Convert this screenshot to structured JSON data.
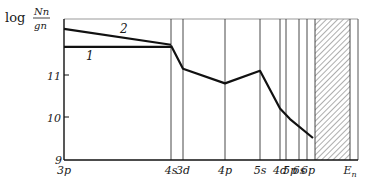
{
  "chart_data": {
    "type": "line",
    "title": "",
    "ylabel": "log N_n / g_n",
    "ylabel_parts": {
      "log": "log",
      "num": "N",
      "num_sub": "n",
      "den": "g",
      "den_sub": "n"
    },
    "xlabel": "",
    "ylim": [
      9,
      12.3
    ],
    "yticks": [
      {
        "label": "9",
        "value": 9
      },
      {
        "label": "10",
        "value": 10
      },
      {
        "label": "11",
        "value": 11
      }
    ],
    "categories": [
      "3p",
      "4s",
      "3d",
      "4p",
      "5s",
      "4d",
      "5p",
      "6s",
      "6p",
      "E_n"
    ],
    "category_labels": [
      {
        "label": "3p",
        "x": 64
      },
      {
        "label": "4s",
        "x": 171
      },
      {
        "label": "3d",
        "x": 183
      },
      {
        "label": "4p",
        "x": 225
      },
      {
        "label": "5s",
        "x": 260
      },
      {
        "label": "4d",
        "x": 280
      },
      {
        "label": "5p",
        "x": 290
      },
      {
        "label": "6s",
        "x": 299
      },
      {
        "label": "6p",
        "x": 308
      },
      {
        "label": "E",
        "sub": "n",
        "x": 350
      }
    ],
    "vertical_lines_x": [
      171,
      183,
      225,
      260,
      280,
      286,
      299,
      307,
      315,
      350
    ],
    "hatched_region": {
      "x_start": 315,
      "x_end": 350,
      "label": "continuum above E_n"
    },
    "series": [
      {
        "name": "1",
        "points": [
          {
            "level": "3p",
            "x": 64,
            "value": 11.67
          },
          {
            "level": "4s",
            "x": 171,
            "value": 11.67
          }
        ]
      },
      {
        "name": "2",
        "points": [
          {
            "level": "3p",
            "x": 64,
            "value": 12.1
          },
          {
            "level": "4s",
            "x": 171,
            "value": 11.72
          }
        ]
      },
      {
        "name": "common",
        "points": [
          {
            "level": "4s",
            "x": 171,
            "value": 11.7
          },
          {
            "level": "3d",
            "x": 183,
            "value": 11.15
          },
          {
            "level": "4p",
            "x": 225,
            "value": 10.8
          },
          {
            "level": "5s",
            "x": 260,
            "value": 11.1
          },
          {
            "level": "4d",
            "x": 280,
            "value": 10.2
          },
          {
            "level": "5p",
            "x": 290,
            "value": 9.95
          },
          {
            "level": "6p",
            "x": 313,
            "value": 9.5
          }
        ]
      }
    ],
    "curve_labels": [
      {
        "text": "1",
        "x": 86,
        "y": 60
      },
      {
        "text": "2",
        "x": 120,
        "y": 33
      }
    ],
    "grid": false,
    "legend": "none"
  }
}
